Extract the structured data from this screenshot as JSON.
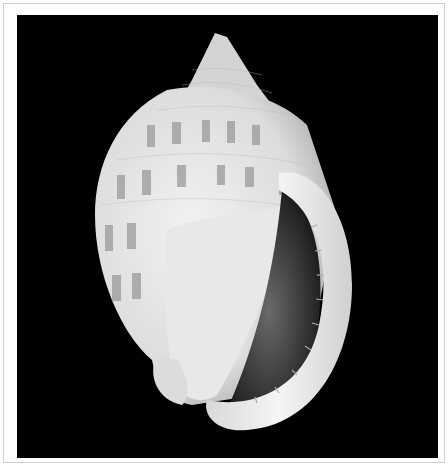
{
  "image": {
    "subject": "seashell",
    "description": "Grayscale photograph of a white bonnet/helmet-type sea snail shell with rows of gray rectangular spots, aperture facing the viewer, on a black background",
    "colors": {
      "background": "#000000",
      "shell": "#e6e6e6",
      "spots": "#9a9a9a",
      "aperture": "#3a3a3a",
      "frame": "#ffffff",
      "frame_border": "#cfcfcf"
    }
  }
}
